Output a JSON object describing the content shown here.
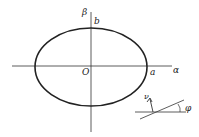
{
  "diagram": {
    "type": "ellipse-coordinate-diagram",
    "labels": {
      "y_axis": "β",
      "x_axis": "α",
      "semi_minor": "b",
      "semi_major": "a",
      "origin": "O",
      "angle": "φ",
      "normal_vector": "ν"
    },
    "colors": {
      "stroke": "#222222",
      "background": "#ffffff"
    }
  }
}
